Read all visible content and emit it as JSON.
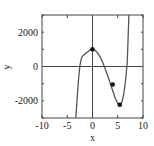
{
  "chart_data": {
    "type": "line",
    "title": "",
    "xlabel": "x",
    "ylabel": "y",
    "xlim": [
      -10,
      10
    ],
    "ylim": [
      -3000,
      3000
    ],
    "grid": false,
    "legend": null,
    "x_ticks": [
      -10,
      -5,
      0,
      5,
      10
    ],
    "x_tick_labels": [
      "-10",
      "-5",
      "0",
      "5",
      "10"
    ],
    "y_ticks": [
      -2000,
      0,
      2000
    ],
    "y_tick_labels": [
      "-2000",
      "0",
      "2000"
    ],
    "reference_lines": {
      "x": 0,
      "y": 0
    },
    "series": [
      {
        "name": "f(x)",
        "color": "#555555",
        "x": [
          -3.3,
          -3.0,
          -2.75,
          -2.5,
          -2.25,
          -2.0,
          -1.5,
          -1.0,
          -0.5,
          0.0,
          0.5,
          1.0,
          1.5,
          2.0,
          2.5,
          3.0,
          3.5,
          4.0,
          4.5,
          5.0,
          5.4,
          5.8,
          6.2,
          6.6,
          6.9,
          7.2
        ],
        "y": [
          -3000,
          -1750,
          -700,
          50,
          420,
          600,
          720,
          850,
          960,
          1000,
          950,
          800,
          560,
          250,
          -120,
          -540,
          -980,
          -1400,
          -1850,
          -2150,
          -2230,
          -2100,
          -1600,
          -700,
          300,
          3000
        ]
      }
    ],
    "markers": [
      {
        "x": 0,
        "y": 1000
      },
      {
        "x": 4.0,
        "y": -1050
      },
      {
        "x": 5.4,
        "y": -2230
      }
    ],
    "marker_color": "#111111"
  }
}
